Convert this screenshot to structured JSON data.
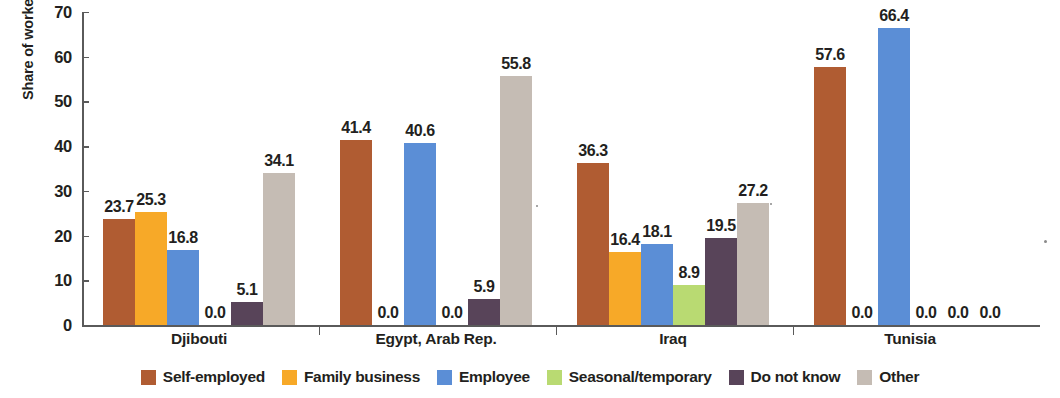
{
  "chart_data": {
    "type": "bar",
    "title": "",
    "xlabel": "",
    "ylabel": "Share of workers (%)",
    "ylim": [
      0,
      70
    ],
    "ytick_step": 10,
    "yticks": [
      "0",
      "10",
      "20",
      "30",
      "40",
      "50",
      "60",
      "70"
    ],
    "grid": false,
    "legend_position": "bottom",
    "categories": [
      "Djibouti",
      "Egypt, Arab Rep.",
      "Iraq",
      "Tunisia"
    ],
    "series": [
      {
        "name": "Self-employed",
        "color": "#b05c32",
        "values": [
          23.7,
          41.4,
          36.3,
          57.6
        ],
        "labels": [
          "23.7",
          "41.4",
          "36.3",
          "57.6"
        ]
      },
      {
        "name": "Family business",
        "color": "#f7a928",
        "values": [
          25.3,
          0.0,
          16.4,
          0.0
        ],
        "labels": [
          "25.3",
          "0.0",
          "16.4",
          "0.0"
        ]
      },
      {
        "name": "Employee",
        "color": "#5b8ed6",
        "values": [
          16.8,
          40.6,
          18.1,
          66.4
        ],
        "labels": [
          "16.8",
          "40.6",
          "18.1",
          "66.4"
        ]
      },
      {
        "name": "Seasonal/temporary",
        "color": "#b9da72",
        "values": [
          0.0,
          0.0,
          8.9,
          0.0
        ],
        "labels": [
          "0.0",
          "0.0",
          "8.9",
          "0.0"
        ]
      },
      {
        "name": "Do not know",
        "color": "#584459",
        "values": [
          5.1,
          5.9,
          19.5,
          0.0
        ],
        "labels": [
          "5.1",
          "5.9",
          "19.5",
          "0.0"
        ]
      },
      {
        "name": "Other",
        "color": "#c5bcb4",
        "values": [
          34.1,
          55.8,
          27.2,
          0.0
        ],
        "labels": [
          "34.1",
          "55.8",
          "27.2",
          "0.0"
        ]
      }
    ]
  }
}
